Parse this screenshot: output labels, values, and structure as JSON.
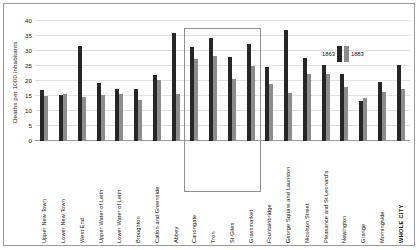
{
  "chart_data": {
    "type": "bar",
    "title": "",
    "xlabel": "",
    "ylabel": "Deaths per 1000 inhabitants",
    "ylim": [
      0,
      40
    ],
    "yticks": [
      0,
      5,
      10,
      15,
      20,
      25,
      30,
      35,
      40
    ],
    "grid": true,
    "legend_position": "inside-right",
    "categories": [
      "Upper New Town",
      "Lower New Town",
      "West End",
      "Upper Water of Leith",
      "Lower Water of Leith",
      "Broughton",
      "Calton and Greenside",
      "Abbey",
      "Canongate",
      "Tron",
      "St Giles",
      "Grassmarket",
      "Fountainbridge",
      "George Square and Lauriston",
      "Nicolson Street",
      "Pleasance and St Leonard's",
      "Newington",
      "Grange",
      "Morningside",
      "WHOLE CITY"
    ],
    "series": [
      {
        "name": "1863",
        "color": "#262626",
        "values": [
          17,
          15.2,
          31.7,
          19.3,
          17.4,
          17.4,
          21.9,
          36.1,
          31.2,
          34.2,
          28.1,
          32.4,
          24.8,
          37,
          27.6,
          25.2,
          22.5,
          13.3,
          19.8,
          25.3
        ]
      },
      {
        "name": "1883",
        "color": "#8c8c8c",
        "values": [
          14.9,
          15.7,
          14.6,
          15.3,
          15.8,
          13.6,
          20.4,
          15.8,
          27.3,
          28.4,
          20.6,
          24.9,
          19.1,
          16.1,
          22.3,
          22.4,
          18.1,
          14.2,
          16.2,
          17.4
        ]
      }
    ],
    "highlight": {
      "label": "old-town-highlight",
      "from_category": "Canongate",
      "to_category": "Grassmarket",
      "top_value": 37.5
    }
  }
}
